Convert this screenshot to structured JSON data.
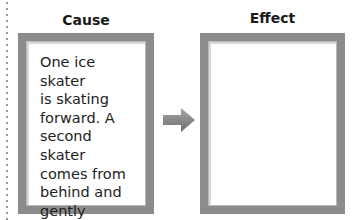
{
  "cause": {
    "title": "Cause",
    "text": "One ice skater\nis skating\nforward. A\nsecond skater\ncomes from\nbehind and\ngently pushes\nthe first skater."
  },
  "effect": {
    "title": "Effect",
    "text": ""
  },
  "arrow": {
    "icon": "right-arrow-icon",
    "direction": "right",
    "color": "#808080"
  },
  "colors": {
    "box_border": "#8c8c8c",
    "background": "#ffffff",
    "text": "#222222"
  }
}
